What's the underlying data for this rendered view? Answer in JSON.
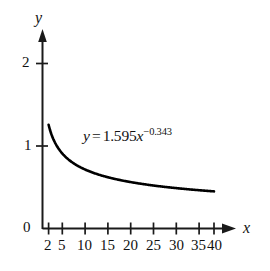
{
  "figure": {
    "background_color": "#ffffff",
    "stroke_color": "#1a1a1a",
    "curve_color": "#000000"
  },
  "axes": {
    "x_axis_name": "x",
    "y_axis_name": "y",
    "x_arrowhead": "arrow-right-icon",
    "y_arrowhead": "arrow-up-icon"
  },
  "equation": {
    "lhs": "y",
    "equals": "=",
    "coefficient": "1.595",
    "variable": "x",
    "exponent": "−0.343",
    "full_text": "y = 1.595x−0.343"
  },
  "chart_data": {
    "type": "line",
    "title": "",
    "subtitle": "",
    "xlabel": "x",
    "ylabel": "y",
    "xlim": [
      0,
      44
    ],
    "ylim": [
      0,
      2.35
    ],
    "grid": false,
    "legend": null,
    "annotations": [
      {
        "text": "y = 1.595x^-0.343",
        "x": 12,
        "y": 1.0
      }
    ],
    "xticks": [
      2,
      5,
      10,
      15,
      20,
      25,
      30,
      35,
      40
    ],
    "xtick_labels": [
      "2",
      "5",
      "10",
      "15",
      "20",
      "25",
      "30",
      "35",
      "40"
    ],
    "yticks": [
      0,
      1,
      2
    ],
    "ytick_labels": [
      "0",
      "1",
      "2"
    ],
    "series": [
      {
        "name": "y = 1.595x^-0.343",
        "equation": "y = 1.595 * x^(-0.343)",
        "coefficient": 1.595,
        "exponent": -0.343,
        "x": [
          2,
          3,
          4,
          5,
          6,
          8,
          10,
          12,
          15,
          18,
          20,
          24,
          28,
          32,
          36,
          40
        ],
        "values": [
          1.257,
          1.108,
          1.015,
          0.947,
          0.895,
          0.819,
          0.765,
          0.724,
          0.677,
          0.64,
          0.62,
          0.585,
          0.558,
          0.536,
          0.517,
          0.501
        ]
      }
    ]
  },
  "ticks": {
    "x": [
      {
        "label": "2",
        "value": 2
      },
      {
        "label": "5",
        "value": 5
      },
      {
        "label": "10",
        "value": 10
      },
      {
        "label": "15",
        "value": 15
      },
      {
        "label": "20",
        "value": 20
      },
      {
        "label": "25",
        "value": 25
      },
      {
        "label": "30",
        "value": 30
      },
      {
        "label": "35",
        "value": 35
      },
      {
        "label": "40",
        "value": 40
      }
    ],
    "y": [
      {
        "label": "0",
        "value": 0
      },
      {
        "label": "1",
        "value": 1
      },
      {
        "label": "2",
        "value": 2
      }
    ]
  }
}
